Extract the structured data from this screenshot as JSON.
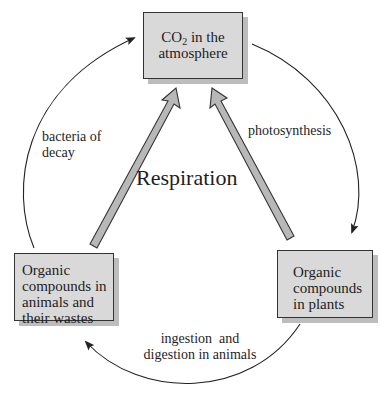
{
  "diagram": {
    "title": "Respiration",
    "nodes": {
      "atmosphere": {
        "line1_prefix": "CO",
        "line1_subscript": "2",
        "line1_suffix": " in the",
        "line2": "atmosphere"
      },
      "animals": {
        "lines": [
          "Organic",
          "compounds in",
          "animals and",
          "their wastes"
        ]
      },
      "plants": {
        "lines": [
          "Organic",
          "compounds",
          "in plants"
        ]
      }
    },
    "edges": {
      "decay": {
        "lines": [
          "bacteria of",
          "decay"
        ],
        "from": "animals",
        "to": "atmosphere"
      },
      "photosynthesis": {
        "lines": [
          "photosynthesis"
        ],
        "from": "atmosphere",
        "to": "plants"
      },
      "ingestion": {
        "lines": [
          "ingestion  and",
          "digestion in animals"
        ],
        "from": "plants",
        "to": "animals"
      },
      "respiration_from_animals": {
        "from": "animals",
        "to": "atmosphere",
        "style": "thick-gray-arrow"
      },
      "respiration_from_plants": {
        "from": "plants",
        "to": "atmosphere",
        "style": "thick-gray-arrow"
      }
    },
    "colors": {
      "box_fill": "#d9d9d9",
      "box_border": "#333333",
      "box_shadow": "#bdbdbd",
      "thick_arrow_fill": "#b8b8b8",
      "line": "#222222"
    }
  }
}
